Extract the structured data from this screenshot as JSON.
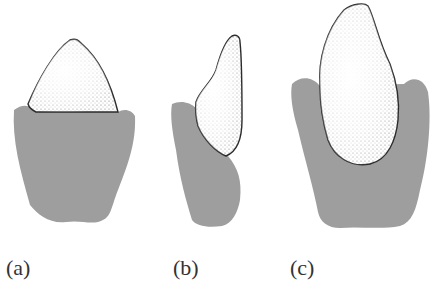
{
  "figure": {
    "panels": [
      {
        "id": "a",
        "label": "(a)"
      },
      {
        "id": "b",
        "label": "(b)"
      },
      {
        "id": "c",
        "label": "(c)"
      }
    ],
    "colors": {
      "gum": "#9e9e9e",
      "tooth_fill": "#ffffff",
      "outline": "#2a2a2a",
      "stipple": "#555555"
    }
  }
}
